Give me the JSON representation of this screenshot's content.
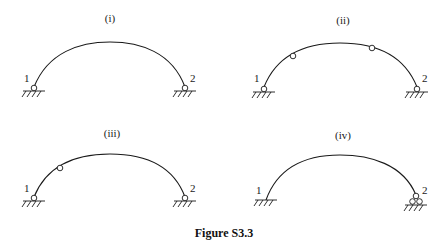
{
  "figure": {
    "caption": "Figure S3.3",
    "panels": [
      {
        "id": "i",
        "label": "(i)",
        "node_labels": [
          "1",
          "2"
        ],
        "supports": [
          "pin",
          "pin"
        ],
        "internal_hinges": 0
      },
      {
        "id": "ii",
        "label": "(ii)",
        "node_labels": [
          "1",
          "2"
        ],
        "supports": [
          "pin",
          "pin"
        ],
        "internal_hinges": 2
      },
      {
        "id": "iii",
        "label": "(iii)",
        "node_labels": [
          "1",
          "2"
        ],
        "supports": [
          "pin",
          "pin"
        ],
        "internal_hinges": 1
      },
      {
        "id": "iv",
        "label": "(iv)",
        "node_labels": [
          "1",
          "2"
        ],
        "supports": [
          "fixed",
          "roller"
        ],
        "internal_hinges": 0
      }
    ]
  }
}
